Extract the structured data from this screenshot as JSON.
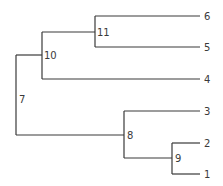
{
  "diagram": {
    "type": "dendrogram",
    "orientation": "left-to-right",
    "line_color": "#3a3a3a",
    "background": "#ffffff",
    "nodes": [
      {
        "id": "7",
        "label": "7",
        "kind": "internal",
        "x": 16,
        "y": 95,
        "children": [
          "10",
          "8"
        ],
        "label_x": 19,
        "label_y": 103
      },
      {
        "id": "10",
        "label": "10",
        "kind": "internal",
        "x": 42,
        "y": 55,
        "children": [
          "11",
          "4"
        ],
        "label_x": 44,
        "label_y": 59
      },
      {
        "id": "11",
        "label": "11",
        "kind": "internal",
        "x": 95,
        "y": 32,
        "children": [
          "6",
          "5"
        ],
        "label_x": 97,
        "label_y": 36
      },
      {
        "id": "8",
        "label": "8",
        "kind": "internal",
        "x": 124,
        "y": 135,
        "children": [
          "3",
          "9"
        ],
        "label_x": 127,
        "label_y": 139
      },
      {
        "id": "9",
        "label": "9",
        "kind": "internal",
        "x": 172,
        "y": 158,
        "children": [
          "2",
          "1"
        ],
        "label_x": 175,
        "label_y": 162
      },
      {
        "id": "6",
        "label": "6",
        "kind": "leaf",
        "x": 200,
        "y": 16,
        "label_x": 204,
        "label_y": 20
      },
      {
        "id": "5",
        "label": "5",
        "kind": "leaf",
        "x": 200,
        "y": 47,
        "label_x": 204,
        "label_y": 51
      },
      {
        "id": "4",
        "label": "4",
        "kind": "leaf",
        "x": 200,
        "y": 79,
        "label_x": 204,
        "label_y": 83
      },
      {
        "id": "3",
        "label": "3",
        "kind": "leaf",
        "x": 200,
        "y": 111,
        "label_x": 204,
        "label_y": 115
      },
      {
        "id": "2",
        "label": "2",
        "kind": "leaf",
        "x": 200,
        "y": 143,
        "label_x": 204,
        "label_y": 147
      },
      {
        "id": "1",
        "label": "1",
        "kind": "leaf",
        "x": 200,
        "y": 174,
        "label_x": 204,
        "label_y": 178
      }
    ],
    "edges": [
      {
        "id": "e7-v",
        "d": "M16 55 L16 135"
      },
      {
        "id": "e7-10",
        "d": "M16 55 L42 55"
      },
      {
        "id": "e7-8",
        "d": "M16 135 L124 135"
      },
      {
        "id": "e10-v",
        "d": "M42 32 L42 79"
      },
      {
        "id": "e10-11",
        "d": "M42 32 L95 32"
      },
      {
        "id": "e10-4",
        "d": "M42 79 L200 79"
      },
      {
        "id": "e11-v",
        "d": "M95 16 L95 47"
      },
      {
        "id": "e11-6",
        "d": "M95 16 L200 16"
      },
      {
        "id": "e11-5",
        "d": "M95 47 L200 47"
      },
      {
        "id": "e8-v",
        "d": "M124 111 L124 158"
      },
      {
        "id": "e8-3",
        "d": "M124 111 L200 111"
      },
      {
        "id": "e8-9",
        "d": "M124 158 L172 158"
      },
      {
        "id": "e9-v",
        "d": "M172 143 L172 174"
      },
      {
        "id": "e9-2",
        "d": "M172 143 L200 143"
      },
      {
        "id": "e9-1",
        "d": "M172 174 L200 174"
      }
    ]
  }
}
